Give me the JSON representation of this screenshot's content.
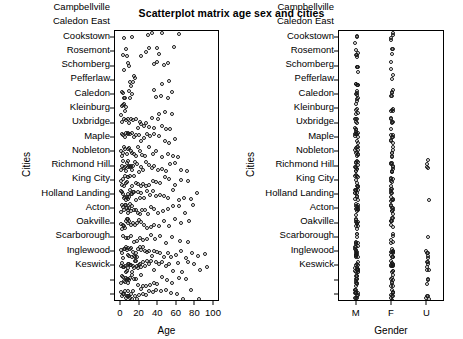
{
  "chart_data": {
    "type": "scatter",
    "title": "Scatterplot matrix age sex and cities",
    "panels": [
      {
        "id": "age-vs-cities",
        "xlabel": "Age",
        "ylabel": "Cities",
        "x_type": "numeric",
        "xlim": [
          0,
          100
        ],
        "xticks": [
          0,
          20,
          40,
          60,
          80,
          100
        ],
        "xticklabels": [
          "0",
          "20",
          "40",
          "60",
          "80",
          "100"
        ],
        "grid": false,
        "categories": [
          "Campbellville",
          "Caledon East",
          "Cookstown",
          "Rosemont",
          "Schomberg",
          "Pefferlaw",
          "Caledon",
          "Kleinburg",
          "Uxbridge",
          "Maple",
          "Nobleton",
          "Richmond Hill",
          "King City",
          "Holland Landing",
          "Acton",
          "Oakville",
          "Scarborough",
          "Inglewood",
          "Keswick"
        ],
        "series": [
          {
            "name": "Campbellville",
            "points": [
              3,
              12,
              29,
              33,
              44,
              62
            ]
          },
          {
            "name": "Caledon East",
            "points": [
              2,
              5,
              6,
              22,
              27,
              30,
              39,
              41,
              57
            ]
          },
          {
            "name": "Cookstown",
            "points": [
              3,
              7,
              9,
              36,
              39,
              46,
              51
            ]
          },
          {
            "name": "Rosemont",
            "points": [
              10,
              11,
              13,
              14,
              15,
              44,
              52
            ]
          },
          {
            "name": "Schomberg",
            "points": [
              1,
              2,
              3,
              4,
              9,
              10,
              12,
              36,
              38,
              43,
              50,
              55
            ]
          },
          {
            "name": "Pefferlaw",
            "points": [
              0,
              1,
              2,
              3,
              4,
              5,
              41,
              47,
              55
            ]
          },
          {
            "name": "Caledon",
            "points": [
              1,
              3,
              5,
              7,
              9,
              11,
              13,
              16,
              18,
              20,
              22,
              25,
              27,
              30,
              33,
              36,
              40,
              44,
              48,
              53
            ]
          },
          {
            "name": "Kleinburg",
            "points": [
              1,
              2,
              4,
              5,
              7,
              8,
              10,
              12,
              14,
              16,
              19,
              22,
              25,
              28,
              31,
              35,
              41,
              47,
              52,
              58
            ]
          },
          {
            "name": "Uxbridge",
            "points": [
              0,
              1,
              2,
              3,
              4,
              6,
              8,
              9,
              11,
              12,
              14,
              16,
              18,
              20,
              23,
              26,
              30,
              34,
              38,
              44,
              50,
              56,
              61
            ]
          },
          {
            "name": "Maple",
            "points": [
              0,
              1,
              2,
              3,
              4,
              5,
              6,
              7,
              8,
              9,
              10,
              11,
              12,
              13,
              15,
              17,
              19,
              21,
              24,
              27,
              30,
              33,
              36,
              40,
              44,
              48,
              53,
              58,
              64,
              71
            ]
          },
          {
            "name": "Nobleton",
            "points": [
              0,
              1,
              2,
              3,
              4,
              5,
              6,
              7,
              8,
              10,
              12,
              14,
              16,
              18,
              21,
              24,
              27,
              30,
              34,
              38,
              42,
              47,
              52,
              58,
              65,
              72
            ]
          },
          {
            "name": "Richmond Hill",
            "points": [
              0,
              1,
              2,
              3,
              4,
              5,
              6,
              7,
              8,
              9,
              10,
              11,
              12,
              13,
              14,
              16,
              18,
              20,
              22,
              25,
              28,
              31,
              34,
              38,
              42,
              46,
              51,
              56,
              62,
              68,
              75,
              82
            ]
          },
          {
            "name": "King City",
            "points": [
              0,
              1,
              2,
              3,
              4,
              5,
              6,
              7,
              8,
              9,
              10,
              11,
              12,
              14,
              16,
              18,
              20,
              23,
              26,
              29,
              32,
              36,
              40,
              45,
              50,
              56,
              62,
              69,
              77
            ]
          },
          {
            "name": "Holland Landing",
            "points": [
              0,
              1,
              2,
              3,
              4,
              5,
              6,
              7,
              8,
              9,
              11,
              13,
              15,
              17,
              19,
              22,
              25,
              28,
              32,
              36,
              41,
              46,
              52,
              58,
              65,
              73
            ]
          },
          {
            "name": "Acton",
            "points": [
              2,
              5,
              8,
              11,
              14,
              17,
              20,
              24,
              28,
              32,
              37,
              42,
              48,
              55,
              63,
              72
            ]
          },
          {
            "name": "Oakville",
            "points": [
              0,
              1,
              2,
              3,
              4,
              5,
              6,
              7,
              8,
              9,
              10,
              11,
              12,
              13,
              14,
              15,
              16,
              17,
              18,
              20,
              22,
              24,
              26,
              28,
              30,
              33,
              36,
              39,
              42,
              46,
              50,
              54,
              59,
              64,
              70,
              76,
              83,
              90
            ]
          },
          {
            "name": "Scarborough",
            "points": [
              0,
              1,
              2,
              3,
              4,
              5,
              6,
              7,
              8,
              9,
              10,
              11,
              12,
              13,
              14,
              15,
              16,
              17,
              18,
              19,
              20,
              22,
              24,
              26,
              28,
              30,
              32,
              35,
              38,
              41,
              44,
              48,
              52,
              56,
              61,
              66,
              72,
              78,
              85,
              93
            ]
          },
          {
            "name": "Inglewood",
            "points": [
              0,
              1,
              2,
              3,
              4,
              5,
              6,
              7,
              8,
              9,
              10,
              12,
              14,
              16,
              18,
              21,
              24,
              27,
              31,
              35,
              39,
              44,
              49,
              55,
              62,
              70
            ]
          },
          {
            "name": "Keswick",
            "points": [
              0,
              1,
              2,
              3,
              4,
              5,
              6,
              7,
              8,
              9,
              10,
              11,
              12,
              13,
              15,
              17,
              19,
              21,
              24,
              27,
              30,
              34,
              38,
              43,
              48,
              54,
              60,
              67,
              75,
              84
            ]
          }
        ]
      },
      {
        "id": "gender-vs-cities",
        "xlabel": "Gender",
        "ylabel": "Cities",
        "x_type": "categorical",
        "xticklabels": [
          "M",
          "F",
          "U"
        ],
        "grid": false,
        "categories": [
          "Campbellville",
          "Caledon East",
          "Cookstown",
          "Rosemont",
          "Schomberg",
          "Pefferlaw",
          "Caledon",
          "Kleinburg",
          "Uxbridge",
          "Maple",
          "Nobleton",
          "Richmond Hill",
          "King City",
          "Holland Landing",
          "Acton",
          "Oakville",
          "Scarborough",
          "Inglewood",
          "Keswick"
        ],
        "series": [
          {
            "name": "Campbellville",
            "M": 3,
            "F": 4,
            "U": 0
          },
          {
            "name": "Caledon East",
            "M": 5,
            "F": 3,
            "U": 0
          },
          {
            "name": "Cookstown",
            "M": 4,
            "F": 2,
            "U": 0
          },
          {
            "name": "Rosemont",
            "M": 5,
            "F": 2,
            "U": 0
          },
          {
            "name": "Schomberg",
            "M": 7,
            "F": 5,
            "U": 0
          },
          {
            "name": "Pefferlaw",
            "M": 5,
            "F": 4,
            "U": 0
          },
          {
            "name": "Caledon",
            "M": 8,
            "F": 6,
            "U": 0
          },
          {
            "name": "Kleinburg",
            "M": 9,
            "F": 7,
            "U": 0
          },
          {
            "name": "Uxbridge",
            "M": 10,
            "F": 6,
            "U": 0
          },
          {
            "name": "Maple",
            "M": 12,
            "F": 9,
            "U": 4
          },
          {
            "name": "Nobleton",
            "M": 9,
            "F": 6,
            "U": 0
          },
          {
            "name": "Richmond Hill",
            "M": 12,
            "F": 10,
            "U": 1
          },
          {
            "name": "King City",
            "M": 11,
            "F": 8,
            "U": 0
          },
          {
            "name": "Holland Landing",
            "M": 10,
            "F": 7,
            "U": 0
          },
          {
            "name": "Acton",
            "M": 7,
            "F": 5,
            "U": 1
          },
          {
            "name": "Oakville",
            "M": 14,
            "F": 11,
            "U": 5
          },
          {
            "name": "Scarborough",
            "M": 15,
            "F": 12,
            "U": 6
          },
          {
            "name": "Inglewood",
            "M": 11,
            "F": 8,
            "U": 3
          },
          {
            "name": "Keswick",
            "M": 13,
            "F": 10,
            "U": 4
          }
        ]
      }
    ]
  },
  "style": {
    "point_stroke": "#1a1a1a",
    "axis_color": "#000000",
    "background": "#ffffff"
  }
}
